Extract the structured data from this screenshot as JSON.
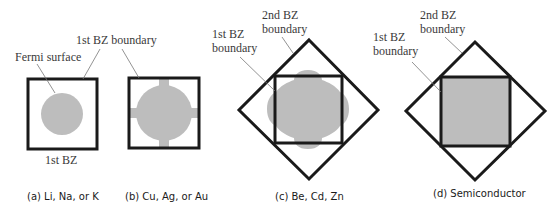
{
  "colors": {
    "fermi_fill": "#bdbdbd",
    "boundary_stroke": "#1a1a1a",
    "label_text": "#3a3a3a",
    "caption_text": "#1a1a1a",
    "leader_line": "#777777"
  },
  "panels": [
    {
      "id": "a",
      "caption": "(a) Li, Na, or K",
      "labels": {
        "fermi_surface": "Fermi surface",
        "first_bz_boundary": "1st BZ boundary",
        "first_bz": "1st BZ"
      }
    },
    {
      "id": "b",
      "caption": "(b) Cu, Ag, or Au"
    },
    {
      "id": "c",
      "caption": "(c) Be, Cd, Zn",
      "labels": {
        "second_bz_line1": "2nd BZ",
        "second_bz_line2": "boundary",
        "first_bz_line1": "1st BZ",
        "first_bz_line2": "boundary"
      }
    },
    {
      "id": "d",
      "caption": "(d) Semiconductor",
      "labels": {
        "second_bz_line1": "2nd BZ",
        "second_bz_line2": "boundary",
        "first_bz_line1": "1st BZ",
        "first_bz_line2": "boundary"
      }
    }
  ]
}
